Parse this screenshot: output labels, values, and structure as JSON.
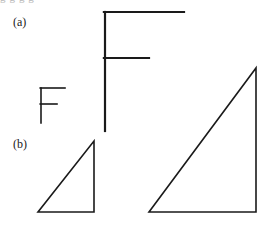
{
  "figure": {
    "background_color": "#ffffff",
    "stroke_color": "#1a1a1a",
    "width": 273,
    "height": 233,
    "clipped_header_text": "g  g  g  g",
    "panels": [
      {
        "id": "a",
        "label": "(a)",
        "label_x": 13,
        "label_y": 16,
        "description": "Two letter-F line figures at different scales"
      },
      {
        "id": "b",
        "label": "(b)",
        "label_x": 13,
        "label_y": 138,
        "description": "Two right-triangle line figures at different scales"
      }
    ],
    "shapes": [
      {
        "name": "small-f-glyph",
        "panel": "a",
        "type": "polyline-group",
        "stroke_width": 1.6,
        "segments": [
          {
            "name": "stem",
            "x1": 41,
            "y1": 88,
            "x2": 41,
            "y2": 123
          },
          {
            "name": "top-arm",
            "x1": 41,
            "y1": 88,
            "x2": 65,
            "y2": 88
          },
          {
            "name": "middle-arm",
            "x1": 41,
            "y1": 104,
            "x2": 57,
            "y2": 104
          }
        ]
      },
      {
        "name": "large-f-glyph",
        "panel": "a",
        "type": "polyline-group",
        "stroke_width": 2.2,
        "segments": [
          {
            "name": "stem",
            "x1": 105,
            "y1": 12,
            "x2": 105,
            "y2": 131
          },
          {
            "name": "top-arm",
            "x1": 105,
            "y1": 12,
            "x2": 184,
            "y2": 12
          },
          {
            "name": "middle-arm",
            "x1": 105,
            "y1": 58,
            "x2": 149,
            "y2": 58
          }
        ]
      },
      {
        "name": "small-right-triangle",
        "panel": "b",
        "type": "polygon",
        "stroke_width": 1.6,
        "points": [
          {
            "name": "apex",
            "x": 94,
            "y": 141
          },
          {
            "name": "bottom-right",
            "x": 94,
            "y": 212
          },
          {
            "name": "bottom-left",
            "x": 38,
            "y": 212
          }
        ]
      },
      {
        "name": "large-right-triangle",
        "panel": "b",
        "type": "polygon",
        "stroke_width": 1.6,
        "points": [
          {
            "name": "apex",
            "x": 256,
            "y": 68
          },
          {
            "name": "bottom-right",
            "x": 256,
            "y": 212
          },
          {
            "name": "bottom-left",
            "x": 149,
            "y": 212
          }
        ]
      }
    ]
  }
}
